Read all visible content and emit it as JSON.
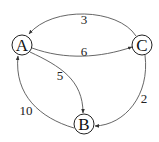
{
  "diagram": {
    "type": "weighted-directed-graph",
    "nodes": [
      {
        "id": "A",
        "label": "A",
        "x": 22,
        "y": 45
      },
      {
        "id": "B",
        "label": "B",
        "x": 84,
        "y": 124
      },
      {
        "id": "C",
        "label": "C",
        "x": 142,
        "y": 45
      }
    ],
    "edges": [
      {
        "from": "C",
        "to": "A",
        "weight": "3"
      },
      {
        "from": "A",
        "to": "C",
        "weight": "6"
      },
      {
        "from": "A",
        "to": "B",
        "weight": "5"
      },
      {
        "from": "C",
        "to": "B",
        "weight": "2"
      },
      {
        "from": "B",
        "to": "A",
        "weight": "10"
      }
    ]
  }
}
